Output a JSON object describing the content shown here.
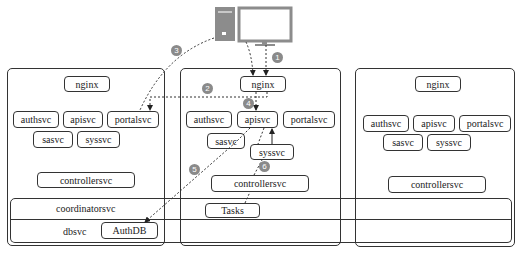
{
  "clusters": [
    {
      "nginx": "nginx",
      "services_row1": [
        "authsvc",
        "apisvc",
        "portalsvc"
      ],
      "services_row2": [
        "sasvc",
        "syssvc"
      ],
      "controller": "controllersvc"
    },
    {
      "nginx": "nginx",
      "services_row1": [
        "authsvc",
        "apisvc",
        "portalsvc"
      ],
      "services_row2": [
        "sasvc",
        "syssvc"
      ],
      "controller": "controllersvc"
    },
    {
      "nginx": "nginx",
      "services_row1": [
        "authsvc",
        "apisvc",
        "portalsvc"
      ],
      "services_row2": [
        "sasvc",
        "syssvc"
      ],
      "controller": "controllersvc"
    }
  ],
  "shared": {
    "coordinator": "coordinatorsvc",
    "coordinator_task": "Tasks",
    "db": "dbsvc",
    "db_store": "AuthDB"
  },
  "client": {
    "icon": "desktop-computer-icon"
  },
  "steps": [
    "1",
    "2",
    "3",
    "4",
    "5",
    "6"
  ],
  "colors": {
    "line": "#333333",
    "badge": "#8a8a8a",
    "computer": "#8c8c8c"
  }
}
